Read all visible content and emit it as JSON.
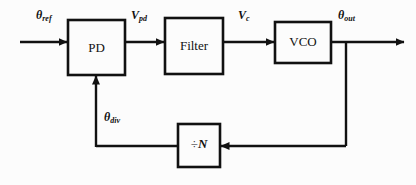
{
  "diagram": {
    "type": "block-diagram",
    "background_color": "#fcfcfc",
    "line_color": "#111111",
    "blocks": [
      {
        "id": "pd",
        "label": "PD",
        "x": 68,
        "y": 20,
        "w": 57,
        "h": 55
      },
      {
        "id": "filter",
        "label": "Filter",
        "x": 165,
        "y": 18,
        "w": 58,
        "h": 56
      },
      {
        "id": "vco",
        "label": "VCO",
        "x": 275,
        "y": 22,
        "w": 56,
        "h": 41
      },
      {
        "id": "divider",
        "label": "÷N",
        "x": 178,
        "y": 124,
        "w": 42,
        "h": 43
      }
    ],
    "signals": [
      {
        "id": "theta_ref",
        "base": "θ",
        "sub": "ref",
        "x": 36,
        "y": 8
      },
      {
        "id": "v_pd",
        "base": "V",
        "sub": "pd",
        "x": 131,
        "y": 8
      },
      {
        "id": "v_c",
        "base": "V",
        "sub": "c",
        "x": 238,
        "y": 8
      },
      {
        "id": "theta_out",
        "base": "θ",
        "sub": "out",
        "x": 338,
        "y": 8
      },
      {
        "id": "theta_div",
        "base": "θ",
        "sub": "div",
        "x": 104,
        "y": 110
      }
    ],
    "divider_symbol": "÷",
    "divider_variable": "N"
  }
}
